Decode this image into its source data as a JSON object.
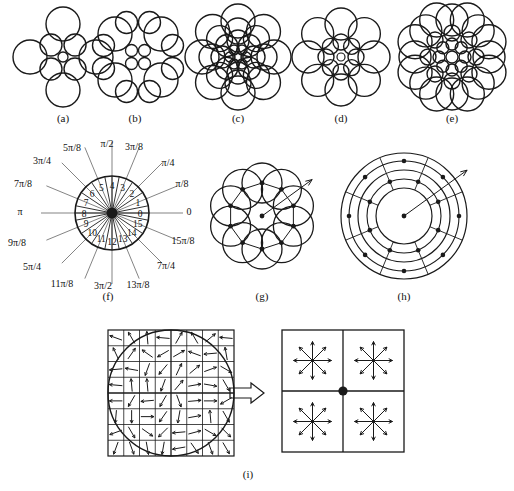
{
  "figure": {
    "background_color": "#ffffff",
    "stroke_color": "#1a1a1a",
    "panel_labels": [
      {
        "id": "a",
        "text": "(a)",
        "x": 63,
        "y": 122
      },
      {
        "id": "b",
        "text": "(b)",
        "x": 135,
        "y": 122
      },
      {
        "id": "c",
        "text": "(c)",
        "x": 238,
        "y": 122
      },
      {
        "id": "d",
        "text": "(d)",
        "x": 341,
        "y": 122
      },
      {
        "id": "e",
        "text": "(e)",
        "x": 452,
        "y": 122
      },
      {
        "id": "f",
        "text": "(f)",
        "x": 108,
        "y": 300
      },
      {
        "id": "g",
        "text": "(g)",
        "x": 262,
        "y": 300
      },
      {
        "id": "h",
        "text": "(h)",
        "x": 404,
        "y": 300
      },
      {
        "id": "i",
        "text": "(i)",
        "x": 248,
        "y": 478
      }
    ]
  },
  "panel_a": {
    "label": "(a)",
    "center": {
      "x": 63,
      "y": 57
    },
    "center_circle_r": 5,
    "rings": [
      {
        "name": "inner-ring",
        "count": 4,
        "radius": 17,
        "circle_r": 11,
        "angle_offset_deg": 45
      },
      {
        "name": "outer-ring",
        "count": 4,
        "radius": 33,
        "circle_r": 17,
        "angle_offset_deg": 0
      }
    ]
  },
  "panel_b": {
    "label": "(b)",
    "center": {
      "x": 138,
      "y": 57
    },
    "grid": {
      "small": {
        "count": 4,
        "circle_r": 6,
        "spacing": 13
      },
      "medium": {
        "count": 12,
        "circle_r": 11,
        "spacing": 23
      },
      "large": {
        "count": 4,
        "circle_r": 17,
        "spacing": 46
      }
    }
  },
  "panel_c": {
    "label": "(c)",
    "center": {
      "x": 238,
      "y": 57
    },
    "center_circle_r": 4,
    "rings": [
      {
        "name": "ring-1",
        "count": 6,
        "radius": 8,
        "circle_r": 5
      },
      {
        "name": "ring-2",
        "count": 8,
        "radius": 16,
        "circle_r": 11
      },
      {
        "name": "ring-3",
        "count": 8,
        "radius": 26,
        "circle_r": 13
      },
      {
        "name": "ring-4",
        "count": 8,
        "radius": 36,
        "circle_r": 17
      }
    ]
  },
  "panel_d": {
    "label": "(d)",
    "center": {
      "x": 341,
      "y": 57
    },
    "center_circle_r": 4,
    "rings": [
      {
        "name": "inner-ring",
        "count": 8,
        "radius": 15,
        "circle_r": 8
      },
      {
        "name": "outer-ring",
        "count": 8,
        "radius": 33,
        "circle_r": 16
      }
    ]
  },
  "panel_e": {
    "label": "(e)",
    "center": {
      "x": 452,
      "y": 57
    },
    "center_circle_r": 6,
    "rings": [
      {
        "name": "ring-1",
        "count": 8,
        "radius": 13,
        "circle_r": 6
      },
      {
        "name": "ring-2",
        "count": 8,
        "radius": 24,
        "circle_r": 8
      },
      {
        "name": "ring-3",
        "count": 8,
        "radius": 37,
        "circle_r": 16
      },
      {
        "name": "ring-4",
        "count": 8,
        "radius": 40,
        "circle_r": 17,
        "angle_offset_deg": 22.5
      }
    ]
  },
  "panel_f": {
    "label": "(f)",
    "description": "Angular quantization into 16 sectors",
    "center": {
      "x": 112,
      "y": 213
    },
    "radius": 37,
    "sector_count": 16,
    "sector_indices": [
      "0",
      "1",
      "2",
      "3",
      "4",
      "5",
      "6",
      "7",
      "8",
      "9",
      "10",
      "11",
      "12",
      "13",
      "14",
      "15"
    ],
    "angle_labels": [
      {
        "text": "0",
        "angle_deg": 0,
        "lx": 189,
        "ly": 215
      },
      {
        "text": "π/8",
        "angle_deg": 22.5,
        "lx": 182,
        "ly": 187
      },
      {
        "text": "π/4",
        "angle_deg": 45,
        "lx": 168,
        "ly": 166
      },
      {
        "text": "3π/8",
        "angle_deg": 67.5,
        "lx": 134,
        "ly": 150
      },
      {
        "text": "π/2",
        "angle_deg": 90,
        "lx": 107,
        "ly": 147
      },
      {
        "text": "5π/8",
        "angle_deg": 112.5,
        "lx": 72,
        "ly": 151
      },
      {
        "text": "3π/4",
        "angle_deg": 135,
        "lx": 42,
        "ly": 164
      },
      {
        "text": "7π/8",
        "angle_deg": 157.5,
        "lx": 23,
        "ly": 187
      },
      {
        "text": "π",
        "angle_deg": 180,
        "lx": 20,
        "ly": 215
      },
      {
        "text": "9π/8",
        "angle_deg": 202.5,
        "lx": 17,
        "ly": 246
      },
      {
        "text": "5π/4",
        "angle_deg": 225,
        "lx": 32,
        "ly": 270
      },
      {
        "text": "11π/8",
        "angle_deg": 247.5,
        "lx": 62,
        "ly": 287
      },
      {
        "text": "3π/2",
        "angle_deg": 270,
        "lx": 103,
        "ly": 289
      },
      {
        "text": "13π/8",
        "angle_deg": 292.5,
        "lx": 138,
        "ly": 288
      },
      {
        "text": "7π/4",
        "angle_deg": 315,
        "lx": 166,
        "ly": 269
      },
      {
        "text": "15π/8",
        "angle_deg": 337.5,
        "lx": 183,
        "ly": 244
      }
    ]
  },
  "panel_g": {
    "label": "(g)",
    "description": "Overlapping circular sampling regions on a ring with sample points and radial arrow",
    "center": {
      "x": 262,
      "y": 216
    },
    "outer_ring_radius": 43,
    "sample_ring_radius": 33,
    "sample_point_count": 10,
    "sample_circle_r": 20,
    "has_center_point": true,
    "arrow": {
      "angle_deg": 36,
      "length": 62
    }
  },
  "panel_h": {
    "label": "(h)",
    "description": "Log-polar grid with sample points on two rings and a radial arrow",
    "center": {
      "x": 404,
      "y": 216
    },
    "rings": [
      {
        "name": "inner-boundary",
        "radius": 28
      },
      {
        "name": "middle-boundary",
        "radius": 46
      },
      {
        "name": "outer-boundary",
        "radius": 63
      }
    ],
    "sector_count": 8,
    "sample_rings": [
      {
        "radius": 37,
        "count": 8
      },
      {
        "radius": 55,
        "count": 8
      }
    ],
    "has_center_point": true,
    "arrow": {
      "angle_deg": 36,
      "length": 78
    }
  },
  "panel_i": {
    "label": "(i)",
    "description": "Gradient vector field over an 8x8 grid within a circular support region, pooled into four 2x2 orientation histograms",
    "left": {
      "name": "gradient-grid",
      "x": 108,
      "y": 330,
      "w": 126,
      "h": 126,
      "cells": 8,
      "circle": {
        "cx": 171,
        "cy": 393,
        "r": 63
      },
      "arrow_angles_deg": [
        [
          160,
          120,
          95,
          175,
          60,
          120,
          40,
          175
        ],
        [
          115,
          55,
          145,
          210,
          30,
          160,
          185,
          100
        ],
        [
          185,
          170,
          250,
          230,
          65,
          40,
          20,
          330
        ],
        [
          175,
          95,
          95,
          250,
          50,
          10,
          350,
          300
        ],
        [
          180,
          240,
          185,
          240,
          290,
          5,
          0,
          210
        ],
        [
          265,
          270,
          0,
          235,
          260,
          10,
          95,
          300
        ],
        [
          200,
          300,
          325,
          225,
          185,
          15,
          330,
          315
        ],
        [
          250,
          290,
          280,
          260,
          190,
          305,
          290,
          300
        ]
      ]
    },
    "transition_arrow": {
      "name": "block-arrow-right",
      "x": 248,
      "y": 393
    },
    "right": {
      "name": "orientation-histogram-grid",
      "x": 282,
      "y": 330,
      "w": 122,
      "h": 122,
      "quadrants": 4,
      "bins_per_quadrant": 8,
      "bin_angles_deg": [
        0,
        45,
        90,
        135,
        180,
        225,
        270,
        315
      ],
      "center_dot": true
    }
  }
}
